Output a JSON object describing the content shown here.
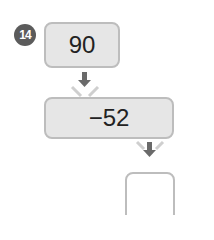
{
  "problem": {
    "number": "14",
    "start_value": "90",
    "operation": "−52",
    "result_value": ""
  },
  "colors": {
    "badge": "#5b5b5b",
    "box_fill": "#e6e6e6",
    "box_border": "#bdbdbd",
    "arrow": "#6a6a6a"
  }
}
